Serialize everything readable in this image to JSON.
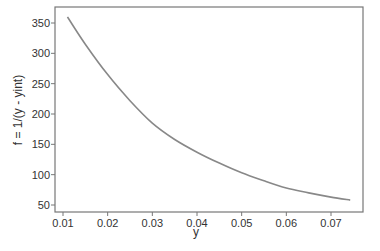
{
  "chart_data": {
    "type": "line",
    "title": "",
    "xlabel": "y",
    "ylabel": "f = 1/(y - yint)",
    "xlim": [
      0.0095,
      0.0765
    ],
    "ylim": [
      40,
      370
    ],
    "grid": false,
    "legend": null,
    "x_ticks": [
      "0.01",
      "0.02",
      "0.03",
      "0.04",
      "0.05",
      "0.06",
      "0.07"
    ],
    "y_ticks": [
      "50",
      "100",
      "150",
      "200",
      "250",
      "300",
      "350"
    ],
    "series": [
      {
        "name": "f",
        "color": "#888888",
        "x": [
          0.011,
          0.015,
          0.02,
          0.025,
          0.03,
          0.035,
          0.04,
          0.045,
          0.05,
          0.055,
          0.06,
          0.065,
          0.07,
          0.0743
        ],
        "y": [
          360,
          315,
          265,
          222,
          185,
          158,
          137,
          119,
          103,
          90,
          78,
          70,
          63,
          58
        ]
      }
    ]
  }
}
